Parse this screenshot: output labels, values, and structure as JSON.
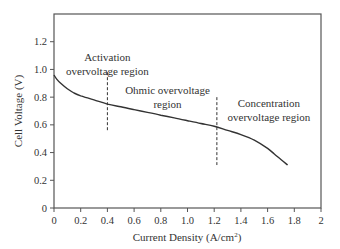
{
  "chart_data": {
    "type": "line",
    "title": "",
    "xlabel": "Current Density (A/cm²)",
    "xlabel_main": "Current Density (A/cm",
    "xlabel_sup": "2",
    "xlabel_close": ")",
    "ylabel": "Cell Voltage (V)",
    "xlim": [
      0,
      2
    ],
    "ylim": [
      0,
      1.4
    ],
    "grid": false,
    "legend": null,
    "x_ticks": [
      "0",
      "0.2",
      "0.4",
      "0.6",
      "0.8",
      "1.0",
      "1.2",
      "1.4",
      "1.6",
      "1.8",
      "2"
    ],
    "x_tick_values": [
      0,
      0.2,
      0.4,
      0.6,
      0.8,
      1.0,
      1.2,
      1.4,
      1.6,
      1.8,
      2.0
    ],
    "y_ticks": [
      "0",
      "0.2",
      "0.4",
      "0.6",
      "0.8",
      "1.0",
      "1.2"
    ],
    "y_tick_values": [
      0,
      0.2,
      0.4,
      0.6,
      0.8,
      1.0,
      1.2
    ],
    "series": [
      {
        "name": "Polarization curve",
        "x": [
          0,
          0.02,
          0.05,
          0.1,
          0.15,
          0.2,
          0.3,
          0.4,
          0.5,
          0.6,
          0.7,
          0.8,
          0.9,
          1.0,
          1.1,
          1.2,
          1.3,
          1.4,
          1.5,
          1.6,
          1.65,
          1.7,
          1.75
        ],
        "y": [
          0.96,
          0.93,
          0.9,
          0.86,
          0.83,
          0.81,
          0.78,
          0.75,
          0.73,
          0.71,
          0.69,
          0.67,
          0.65,
          0.63,
          0.61,
          0.59,
          0.56,
          0.53,
          0.49,
          0.43,
          0.39,
          0.35,
          0.31
        ]
      }
    ],
    "annotations": [
      {
        "lines": [
          "Activation",
          "overvoltage region"
        ],
        "x": 0.4,
        "y": 1.06
      },
      {
        "lines": [
          "Ohmic overvoltage",
          "region"
        ],
        "x": 0.85,
        "y": 0.82
      },
      {
        "lines": [
          "Concentration",
          "overvoltage region"
        ],
        "x": 1.61,
        "y": 0.73
      }
    ],
    "dividers": [
      {
        "x": 0.4,
        "y_from": 0.55,
        "y_to": 0.98,
        "style": "dashed"
      },
      {
        "x": 1.22,
        "y_from": 0.31,
        "y_to": 0.8,
        "style": "dashed"
      }
    ]
  },
  "colors": {
    "axis": "#555555",
    "curve": "#333333",
    "text": "#333333"
  }
}
